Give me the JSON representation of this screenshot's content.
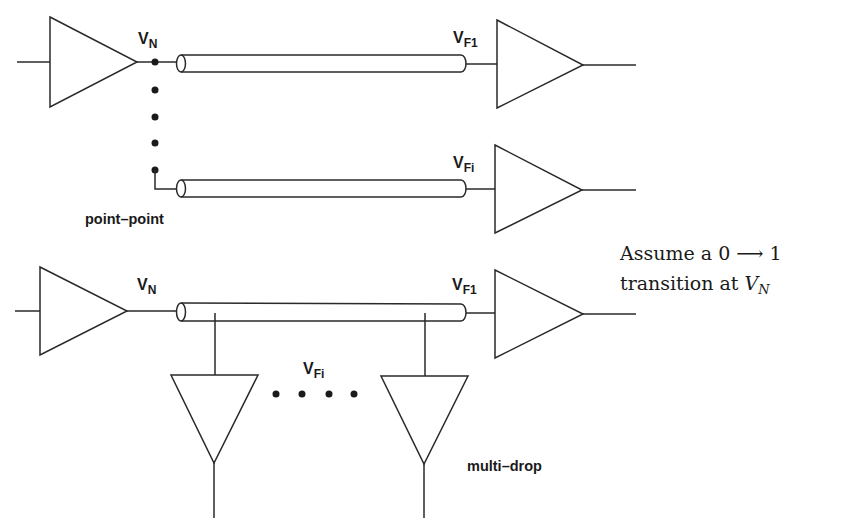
{
  "labels": {
    "top_node": {
      "main": "V",
      "sub": "N"
    },
    "top_far1": {
      "main": "V",
      "sub": "F1"
    },
    "top_fari": {
      "main": "V",
      "sub": "Fi"
    },
    "top_caption": "point–point",
    "bottom_node": {
      "main": "V",
      "sub": "N"
    },
    "bottom_far1": {
      "main": "V",
      "sub": "F1"
    },
    "bottom_fari": {
      "main": "V",
      "sub": "Fi"
    },
    "bottom_caption": "multi–drop"
  },
  "note": {
    "line1": "Assume a 0 ⟶ 1",
    "line2_prefix": "transition at ",
    "line2_var": "V",
    "line2_sub": "N"
  },
  "colors": {
    "stroke": "#2a2a2a",
    "background": "#ffffff"
  }
}
